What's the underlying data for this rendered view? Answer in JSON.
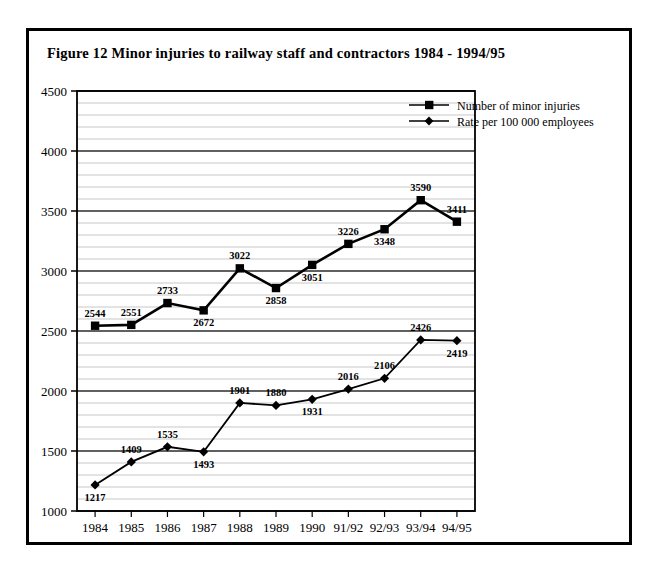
{
  "figure": {
    "title": "Figure 12  Minor injuries to railway staff and contractors 1984 - 1994/95",
    "border_color": "#000000",
    "background_color": "#ffffff"
  },
  "chart_data": {
    "type": "line",
    "title": "Figure 12  Minor injuries to railway staff and contractors 1984 - 1994/95",
    "xlabel": "",
    "ylabel": "",
    "categories": [
      "1984",
      "1985",
      "1986",
      "1987",
      "1988",
      "1989",
      "1990",
      "91/92",
      "92/93",
      "93/94",
      "94/95"
    ],
    "ylim": [
      1000,
      4500
    ],
    "ytick_labels": [
      "1000",
      "1500",
      "2000",
      "2500",
      "3000",
      "3500",
      "4000",
      "4500"
    ],
    "ytick_values": [
      1000,
      1500,
      2000,
      2500,
      3000,
      3500,
      4000,
      4500
    ],
    "ymajor_step": 500,
    "yminor_step": 100,
    "grid": true,
    "legend_position": "top-right",
    "series": [
      {
        "name": "Number of minor injuries",
        "marker": "square",
        "color": "#000000",
        "values": [
          2544,
          2551,
          2733,
          2672,
          3022,
          2858,
          3051,
          3226,
          3348,
          3590,
          3411
        ],
        "labels": [
          "2544",
          "2551",
          "2733",
          "2672",
          "3022",
          "2858",
          "3051",
          "3226",
          "3348",
          "3590",
          "3411"
        ],
        "label_positions": [
          "above",
          "above",
          "above",
          "below",
          "above",
          "below",
          "below",
          "above",
          "below",
          "above",
          "above"
        ]
      },
      {
        "name": "Rate per 100 000 employees",
        "marker": "diamond",
        "color": "#000000",
        "values": [
          1217,
          1409,
          1535,
          1493,
          1901,
          1880,
          1931,
          2016,
          2106,
          2426,
          2419
        ],
        "labels": [
          "1217",
          "1409",
          "1535",
          "1493",
          "1901",
          "1880",
          "1931",
          "2016",
          "2106",
          "2426",
          "2419"
        ],
        "label_positions": [
          "below",
          "above",
          "above",
          "below",
          "above",
          "above",
          "below",
          "above",
          "above",
          "above",
          "below"
        ]
      }
    ]
  }
}
